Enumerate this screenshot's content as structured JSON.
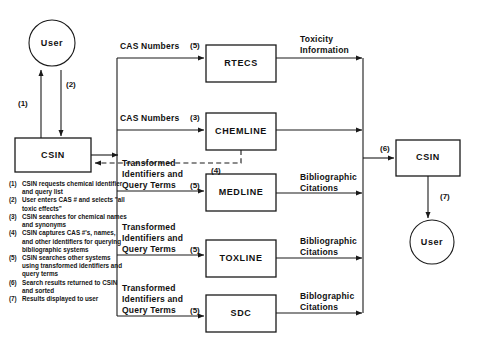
{
  "diagram": {
    "stroke_color": "#1a1a1a",
    "fill_color": "#ffffff",
    "nodes": [
      {
        "id": "user-top",
        "label": "User",
        "shape": "circle",
        "cx": 52,
        "cy": 43,
        "r": 23
      },
      {
        "id": "csin-left",
        "label": "CSIN",
        "shape": "rect",
        "x": 15,
        "y": 138,
        "w": 76,
        "h": 34
      },
      {
        "id": "rtecs",
        "label": "RTECS",
        "shape": "rect",
        "x": 206,
        "y": 45,
        "w": 70,
        "h": 37
      },
      {
        "id": "chemline",
        "label": "CHEMLINE",
        "shape": "rect",
        "x": 206,
        "y": 113,
        "w": 70,
        "h": 37
      },
      {
        "id": "medline",
        "label": "MEDLINE",
        "shape": "rect",
        "x": 206,
        "y": 174,
        "w": 70,
        "h": 37
      },
      {
        "id": "toxline",
        "label": "TOXLINE",
        "shape": "rect",
        "x": 206,
        "y": 240,
        "w": 70,
        "h": 37
      },
      {
        "id": "sdc",
        "label": "SDC",
        "shape": "rect",
        "x": 206,
        "y": 295,
        "w": 70,
        "h": 37
      },
      {
        "id": "csin-right",
        "label": "CSIN",
        "shape": "rect",
        "x": 396,
        "y": 140,
        "w": 64,
        "h": 36
      },
      {
        "id": "user-right",
        "label": "User",
        "shape": "circle",
        "cx": 432,
        "cy": 242,
        "r": 22
      }
    ],
    "edge_labels": [
      {
        "id": "cas-numbers-rtecs",
        "lines": [
          "CAS Numbers"
        ],
        "step": "(5)",
        "x": 120,
        "y": 46,
        "step_x": 190,
        "step_y": 46
      },
      {
        "id": "cas-numbers-chemline",
        "lines": [
          "CAS Numbers"
        ],
        "step": "(3)",
        "x": 120,
        "y": 118,
        "step_x": 190,
        "step_y": 118
      },
      {
        "id": "tiqt-medline",
        "lines": [
          "Transformed",
          "Identifiers and",
          "Query Terms"
        ],
        "step": "(5)",
        "x": 122,
        "y": 163,
        "step_x": 190,
        "step_y": 191
      },
      {
        "id": "tiqt-toxline",
        "lines": [
          "Transformed",
          "Identifiers and",
          "Query Terms"
        ],
        "step": "(5)",
        "x": 122,
        "y": 227,
        "step_x": 190,
        "step_y": 255
      },
      {
        "id": "tiqt-sdc",
        "lines": [
          "Transformed",
          "Identifiers and",
          "Query Terms"
        ],
        "step": "(5)",
        "x": 122,
        "y": 288,
        "step_x": 190,
        "step_y": 316
      },
      {
        "id": "toxicity-information",
        "lines": [
          "Toxicity",
          "Information"
        ],
        "step": "",
        "x": 300,
        "y": 42,
        "step_x": 0,
        "step_y": 0
      },
      {
        "id": "biblio-medline",
        "lines": [
          "Bibliographic",
          "Citations"
        ],
        "step": "",
        "x": 300,
        "y": 178,
        "step_x": 0,
        "step_y": 0
      },
      {
        "id": "biblio-toxline",
        "lines": [
          "Bibliographic",
          "Citations"
        ],
        "step": "",
        "x": 300,
        "y": 242,
        "step_x": 0,
        "step_y": 0
      },
      {
        "id": "biblio-sdc",
        "lines": [
          "Biblographic",
          "Citations"
        ],
        "step": "",
        "x": 300,
        "y": 296,
        "step_x": 0,
        "step_y": 0
      }
    ],
    "step_markers": [
      {
        "id": "step-1",
        "label": "(1)",
        "x": 18,
        "y": 103
      },
      {
        "id": "step-2",
        "label": "(2)",
        "x": 66,
        "y": 84
      },
      {
        "id": "step-4",
        "label": "(4)",
        "x": 211,
        "y": 164
      },
      {
        "id": "step-6",
        "label": "(6)",
        "x": 380,
        "y": 148
      },
      {
        "id": "step-7",
        "label": "(7)",
        "x": 440,
        "y": 196
      }
    ]
  },
  "legend": {
    "items": [
      {
        "num": "(1)",
        "text": "CSIN requests chemical identifier and query list"
      },
      {
        "num": "(2)",
        "text": "User enters CAS # and selects \"all toxic effects\""
      },
      {
        "num": "(3)",
        "text": "CSIN searches for chemical names and synonyms"
      },
      {
        "num": "(4)",
        "text": "CSIN captures CAS #'s, names, and other identifiers for querying bibliographic systems"
      },
      {
        "num": "(5)",
        "text": "CSIN searches other systems using transformed identifiers and query terms"
      },
      {
        "num": "(6)",
        "text": "Search results returned to CSIN and sorted"
      },
      {
        "num": "(7)",
        "text": "Results displayed to user"
      }
    ]
  }
}
